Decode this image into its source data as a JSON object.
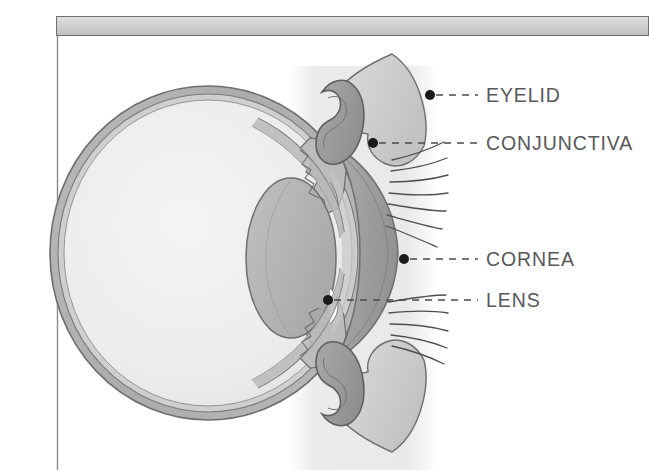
{
  "figure": {
    "kind": "anatomical-diagram",
    "background_color": "#ffffff",
    "ink_color": "#58585a"
  },
  "frame": {
    "header_bar": {
      "name": "header-bar",
      "fill_top": "#d9d9d9",
      "fill_bottom": "#c3c3c3",
      "stroke": "#6b6b6b",
      "x": 56,
      "y": 16,
      "width": 593,
      "height": 20
    },
    "left_rule": {
      "name": "left-border-rule",
      "stroke": "#8a8a8a",
      "x": 57,
      "y1": 36,
      "y2": 470
    },
    "backdrop_band": {
      "name": "backdrop-band",
      "fill": "#ededee",
      "x": 288,
      "y": 66,
      "width": 145,
      "height": 404
    }
  },
  "palette": {
    "sclera_outer": "#b3b3b4",
    "sclera_inner": "#d6d6d7",
    "vitreous": "#eeeeef",
    "lens": "#b6b6b7",
    "cornea": "#a1a1a2",
    "eyelid_skin": "#d0d0d1",
    "conjunctiva": "#9c9c9d",
    "outline": "#6e6e70",
    "lash": "#4f4f51",
    "dot": "#1a1a1a",
    "dash": "#4a4a4c"
  },
  "labels": [
    {
      "id": "eyelid",
      "text": "EYELID",
      "name": "label-eyelid",
      "text_x": 486,
      "text_y": 102,
      "dot": {
        "x": 430,
        "y": 95
      },
      "leader": {
        "x1": 436,
        "y1": 95,
        "x2": 478,
        "y2": 95
      }
    },
    {
      "id": "conjunctiva",
      "text": "CONJUNCTIVA",
      "name": "label-conjunctiva",
      "text_x": 486,
      "text_y": 150,
      "dot": {
        "x": 373,
        "y": 143
      },
      "leader": {
        "x1": 379,
        "y1": 143,
        "x2": 478,
        "y2": 143
      }
    },
    {
      "id": "cornea",
      "text": "CORNEA",
      "name": "label-cornea",
      "text_x": 486,
      "text_y": 266,
      "dot": {
        "x": 404,
        "y": 259
      },
      "leader": {
        "x1": 410,
        "y1": 259,
        "x2": 478,
        "y2": 259
      }
    },
    {
      "id": "lens",
      "text": "LENS",
      "name": "label-lens",
      "text_x": 486,
      "text_y": 307,
      "dot": {
        "x": 328,
        "y": 300
      },
      "leader": {
        "x1": 334,
        "y1": 300,
        "x2": 478,
        "y2": 300
      }
    }
  ],
  "structures": [
    {
      "id": "eyeball-sclera",
      "name": "eyeball-sclera",
      "description": "outer wall of the globe"
    },
    {
      "id": "eyeball-vitreous",
      "name": "eyeball-vitreous-chamber",
      "description": "pale interior of the globe"
    },
    {
      "id": "lens-body",
      "name": "lens-body",
      "description": "elliptical lens behind the pupil"
    },
    {
      "id": "cornea-body",
      "name": "cornea-body",
      "description": "anterior crescent dome"
    },
    {
      "id": "upper-eyelid",
      "name": "upper-eyelid",
      "description": "upper lid with conjunctival fornix"
    },
    {
      "id": "lower-eyelid",
      "name": "lower-eyelid",
      "description": "lower lid with conjunctival fornix"
    },
    {
      "id": "upper-lashes",
      "name": "upper-eyelashes",
      "description": "lash strokes above the lid margin"
    },
    {
      "id": "lower-lashes",
      "name": "lower-eyelashes",
      "description": "lash strokes below the lid margin"
    }
  ]
}
